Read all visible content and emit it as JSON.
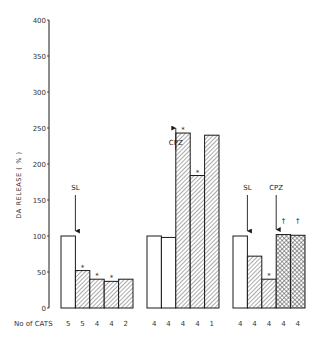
{
  "chart_data": {
    "type": "bar",
    "title": "",
    "xlabel": "",
    "ylabel": "DA RELEASE ( % )",
    "ylim": [
      0,
      400
    ],
    "yticks": [
      0,
      50,
      100,
      150,
      200,
      250,
      300,
      350,
      400
    ],
    "grid": false,
    "legend": null,
    "row_label": "No of CATS",
    "groups": [
      {
        "name": "Group 1",
        "bars": [
          {
            "value": 100,
            "fill": "open",
            "n_cats": 5,
            "mark": ""
          },
          {
            "value": 52,
            "fill": "hatched",
            "n_cats": 5,
            "mark": "*"
          },
          {
            "value": 40,
            "fill": "hatched",
            "n_cats": 4,
            "mark": "*"
          },
          {
            "value": 37,
            "fill": "hatched",
            "n_cats": 4,
            "mark": "*"
          },
          {
            "value": 40,
            "fill": "hatched",
            "n_cats": 2,
            "mark": ""
          }
        ],
        "annotations": [
          {
            "label": "SL",
            "before_bar": 1
          }
        ]
      },
      {
        "name": "Group 2",
        "bars": [
          {
            "value": 100,
            "fill": "open",
            "n_cats": 4,
            "mark": ""
          },
          {
            "value": 98,
            "fill": "open",
            "n_cats": 4,
            "mark": ""
          },
          {
            "value": 243,
            "fill": "hatched",
            "n_cats": 4,
            "mark": "*"
          },
          {
            "value": 184,
            "fill": "hatched",
            "n_cats": 4,
            "mark": "*"
          },
          {
            "value": 240,
            "fill": "hatched",
            "n_cats": 1,
            "mark": ""
          }
        ],
        "annotations": [
          {
            "label": "CPZ",
            "before_bar": 2
          }
        ]
      },
      {
        "name": "Group 3",
        "bars": [
          {
            "value": 100,
            "fill": "open",
            "n_cats": 4,
            "mark": ""
          },
          {
            "value": 72,
            "fill": "hatched",
            "n_cats": 4,
            "mark": ""
          },
          {
            "value": 40,
            "fill": "hatched",
            "n_cats": 4,
            "mark": "*"
          },
          {
            "value": 102,
            "fill": "crosshatched",
            "n_cats": 4,
            "mark": "†"
          },
          {
            "value": 101,
            "fill": "crosshatched",
            "n_cats": 4,
            "mark": "†"
          }
        ],
        "annotations": [
          {
            "label": "SL",
            "before_bar": 1
          },
          {
            "label": "CPZ",
            "before_bar": 3
          }
        ]
      }
    ]
  },
  "colors": {
    "ink": "#1a1a1a",
    "hatch": "#555555",
    "background": "#ffffff"
  }
}
